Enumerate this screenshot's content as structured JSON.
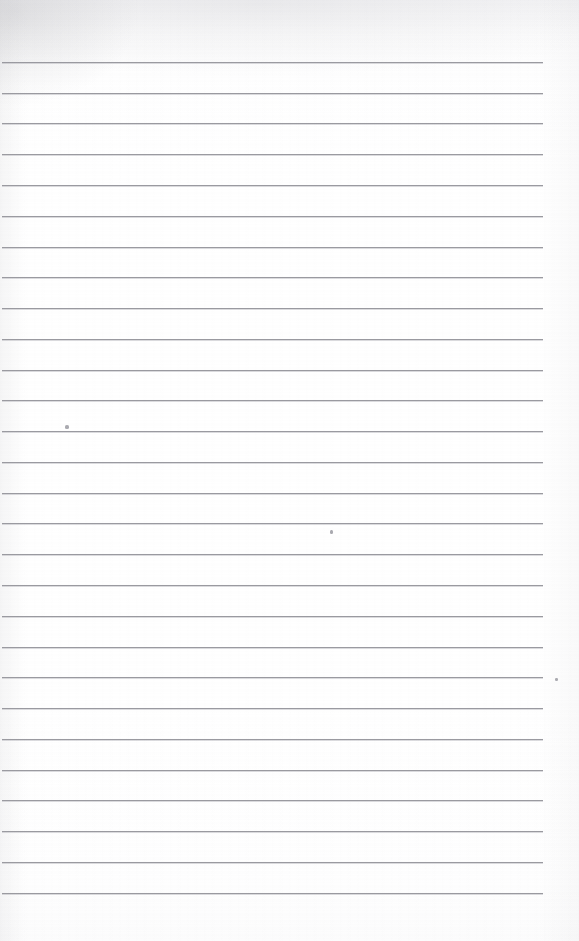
{
  "document": {
    "kind": "scanned-lined-paper",
    "title": "Blank Ruled Notebook Page",
    "page_label": "",
    "text_content": "",
    "width_px": 579,
    "height_px": 941,
    "background_color": "#ffffff",
    "is_blank": true
  },
  "ruling": {
    "line_color": "#9a9aa0",
    "line_thickness_px": 1,
    "line_count": 28,
    "first_line_y": 62,
    "line_spacing_px": 30.8,
    "margin_left_px": 2,
    "margin_right_px": 543,
    "style": "wide-ruled-horizontal",
    "has_vertical_margin_rule": false,
    "lines": [
      {
        "index": 1,
        "y": 62,
        "x_start": 2,
        "x_end": 543
      },
      {
        "index": 2,
        "y": 93,
        "x_start": 2,
        "x_end": 543
      },
      {
        "index": 3,
        "y": 123,
        "x_start": 2,
        "x_end": 543
      },
      {
        "index": 4,
        "y": 154,
        "x_start": 2,
        "x_end": 543
      },
      {
        "index": 5,
        "y": 185,
        "x_start": 2,
        "x_end": 543
      },
      {
        "index": 6,
        "y": 216,
        "x_start": 2,
        "x_end": 543
      },
      {
        "index": 7,
        "y": 247,
        "x_start": 2,
        "x_end": 543
      },
      {
        "index": 8,
        "y": 277,
        "x_start": 2,
        "x_end": 543
      },
      {
        "index": 9,
        "y": 308,
        "x_start": 2,
        "x_end": 543
      },
      {
        "index": 10,
        "y": 339,
        "x_start": 2,
        "x_end": 543
      },
      {
        "index": 11,
        "y": 370,
        "x_start": 2,
        "x_end": 543
      },
      {
        "index": 12,
        "y": 400,
        "x_start": 2,
        "x_end": 543
      },
      {
        "index": 13,
        "y": 431,
        "x_start": 2,
        "x_end": 543
      },
      {
        "index": 14,
        "y": 462,
        "x_start": 2,
        "x_end": 543
      },
      {
        "index": 15,
        "y": 493,
        "x_start": 2,
        "x_end": 543
      },
      {
        "index": 16,
        "y": 523,
        "x_start": 2,
        "x_end": 543
      },
      {
        "index": 17,
        "y": 554,
        "x_start": 2,
        "x_end": 543
      },
      {
        "index": 18,
        "y": 585,
        "x_start": 2,
        "x_end": 543
      },
      {
        "index": 19,
        "y": 616,
        "x_start": 2,
        "x_end": 543
      },
      {
        "index": 20,
        "y": 647,
        "x_start": 2,
        "x_end": 543
      },
      {
        "index": 21,
        "y": 677,
        "x_start": 2,
        "x_end": 543
      },
      {
        "index": 22,
        "y": 708,
        "x_start": 2,
        "x_end": 543
      },
      {
        "index": 23,
        "y": 739,
        "x_start": 2,
        "x_end": 543
      },
      {
        "index": 24,
        "y": 770,
        "x_start": 2,
        "x_end": 543
      },
      {
        "index": 25,
        "y": 800,
        "x_start": 2,
        "x_end": 543
      },
      {
        "index": 26,
        "y": 831,
        "x_start": 2,
        "x_end": 543
      },
      {
        "index": 27,
        "y": 862,
        "x_start": 2,
        "x_end": 543
      },
      {
        "index": 28,
        "y": 893,
        "x_start": 2,
        "x_end": 543
      }
    ]
  },
  "marks": {
    "color": "#8e8e96",
    "items": [
      {
        "name": "speck-upper-left",
        "x": 65,
        "y": 425,
        "w": 4,
        "h": 4
      },
      {
        "name": "speck-middle",
        "x": 330,
        "y": 530,
        "w": 3,
        "h": 4
      },
      {
        "name": "speck-right-edge",
        "x": 555,
        "y": 678,
        "w": 3,
        "h": 3
      }
    ]
  }
}
